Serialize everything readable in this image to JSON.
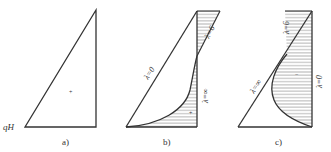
{
  "panels": [
    {
      "id": "a",
      "caption": "a)",
      "base_label": "qH",
      "sign": "+"
    },
    {
      "id": "b",
      "caption": "b)",
      "curves": [
        {
          "label": "λ=0"
        },
        {
          "label": "λ=6"
        },
        {
          "label": "λ=∞"
        }
      ],
      "sign": "+"
    },
    {
      "id": "c",
      "caption": "c)",
      "curves": [
        {
          "label": "λ=∞"
        },
        {
          "label": "λ=6"
        },
        {
          "label": "λ=0"
        }
      ],
      "sign": "−"
    }
  ],
  "colors": {
    "line": "#333333",
    "hatch": "#888888"
  }
}
